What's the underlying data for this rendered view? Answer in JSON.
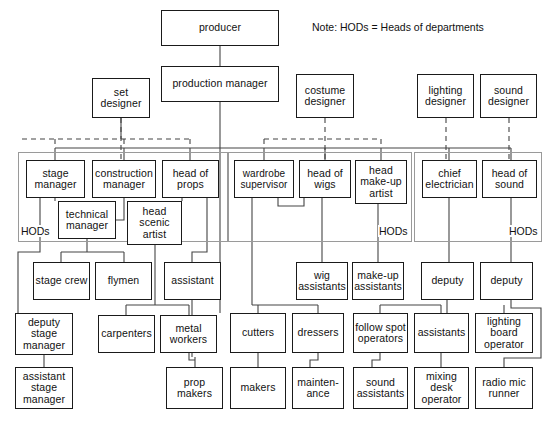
{
  "diagram": {
    "note": "Note: HODs = Heads of departments",
    "group_label": "HODs",
    "colors": {
      "box_border": "#1a1a1a",
      "group_border": "#9a9a9a",
      "line": "#444444",
      "background": "#ffffff",
      "text": "#111111"
    }
  },
  "nodes": [
    {
      "id": "producer",
      "label": "producer",
      "x": 161,
      "y": 10,
      "w": 118,
      "h": 36
    },
    {
      "id": "production-manager",
      "label": "production manager",
      "x": 161,
      "y": 66,
      "w": 118,
      "h": 36
    },
    {
      "id": "set-designer",
      "label": "set designer",
      "x": 92,
      "y": 78,
      "w": 58,
      "h": 40
    },
    {
      "id": "costume-designer",
      "label": "costume designer",
      "x": 296,
      "y": 74,
      "w": 58,
      "h": 44
    },
    {
      "id": "lighting-designer",
      "label": "lighting designer",
      "x": 417,
      "y": 74,
      "w": 57,
      "h": 44
    },
    {
      "id": "sound-designer",
      "label": "sound designer",
      "x": 480,
      "y": 74,
      "w": 57,
      "h": 44
    },
    {
      "id": "stage-manager",
      "label": "stage manager",
      "x": 26,
      "y": 160,
      "w": 59,
      "h": 38
    },
    {
      "id": "construction-manager",
      "label": "construction manager",
      "x": 92,
      "y": 160,
      "w": 64,
      "h": 38
    },
    {
      "id": "head-of-props",
      "label": "head of props",
      "x": 162,
      "y": 160,
      "w": 57,
      "h": 38
    },
    {
      "id": "technical-manager",
      "label": "technical manager",
      "x": 58,
      "y": 201,
      "w": 58,
      "h": 38
    },
    {
      "id": "head-scenic-artist",
      "label": "head scenic artist",
      "x": 127,
      "y": 201,
      "w": 55,
      "h": 44
    },
    {
      "id": "wardrobe-supervisor",
      "label": "wardrobe supervisor",
      "x": 234,
      "y": 160,
      "w": 60,
      "h": 38
    },
    {
      "id": "head-of-wigs",
      "label": "head of wigs",
      "x": 299,
      "y": 160,
      "w": 52,
      "h": 38
    },
    {
      "id": "head-make-up-artist",
      "label": "head make-up artist",
      "x": 355,
      "y": 160,
      "w": 52,
      "h": 44
    },
    {
      "id": "chief-electrician",
      "label": "chief electrician",
      "x": 422,
      "y": 160,
      "w": 55,
      "h": 38
    },
    {
      "id": "head-of-sound",
      "label": "head of sound",
      "x": 482,
      "y": 160,
      "w": 55,
      "h": 38
    },
    {
      "id": "stage-crew",
      "label": "stage crew",
      "x": 33,
      "y": 262,
      "w": 57,
      "h": 38
    },
    {
      "id": "flymen",
      "label": "flymen",
      "x": 95,
      "y": 262,
      "w": 57,
      "h": 38
    },
    {
      "id": "assistant",
      "label": "assistant",
      "x": 164,
      "y": 262,
      "w": 57,
      "h": 38
    },
    {
      "id": "deputy-stage-manager",
      "label": "deputy stage manager",
      "x": 15,
      "y": 313,
      "w": 58,
      "h": 42
    },
    {
      "id": "carpenters",
      "label": "carpenters",
      "x": 98,
      "y": 315,
      "w": 57,
      "h": 38
    },
    {
      "id": "metal-workers",
      "label": "metal workers",
      "x": 160,
      "y": 315,
      "w": 57,
      "h": 38
    },
    {
      "id": "assistant-stage-manager",
      "label": "assistant stage manager",
      "x": 15,
      "y": 367,
      "w": 58,
      "h": 42
    },
    {
      "id": "prop-makers",
      "label": "prop makers",
      "x": 166,
      "y": 367,
      "w": 57,
      "h": 42
    },
    {
      "id": "wig-assistants",
      "label": "wig assistants",
      "x": 296,
      "y": 262,
      "w": 52,
      "h": 38
    },
    {
      "id": "make-up-assistants",
      "label": "make-up assistants",
      "x": 352,
      "y": 262,
      "w": 52,
      "h": 38
    },
    {
      "id": "cutters",
      "label": "cutters",
      "x": 230,
      "y": 313,
      "w": 56,
      "h": 40
    },
    {
      "id": "dressers",
      "label": "dressers",
      "x": 292,
      "y": 313,
      "w": 52,
      "h": 40
    },
    {
      "id": "makers",
      "label": "makers",
      "x": 230,
      "y": 367,
      "w": 56,
      "h": 42
    },
    {
      "id": "maintenance",
      "label": "mainten- ance",
      "x": 292,
      "y": 367,
      "w": 52,
      "h": 42
    },
    {
      "id": "deputy-lighting",
      "label": "deputy",
      "x": 421,
      "y": 262,
      "w": 53,
      "h": 38
    },
    {
      "id": "deputy-sound",
      "label": "deputy",
      "x": 480,
      "y": 262,
      "w": 53,
      "h": 38
    },
    {
      "id": "follow-spot-operators",
      "label": "follow spot operators",
      "x": 353,
      "y": 313,
      "w": 55,
      "h": 40
    },
    {
      "id": "assistants",
      "label": "assistants",
      "x": 414,
      "y": 313,
      "w": 55,
      "h": 40
    },
    {
      "id": "lighting-board-operator",
      "label": "lighting board operator",
      "x": 475,
      "y": 313,
      "w": 58,
      "h": 40
    },
    {
      "id": "sound-assistants",
      "label": "sound assistants",
      "x": 353,
      "y": 367,
      "w": 55,
      "h": 42
    },
    {
      "id": "mixing-desk-operator",
      "label": "mixing desk operator",
      "x": 414,
      "y": 367,
      "w": 55,
      "h": 42
    },
    {
      "id": "radio-mic-runner",
      "label": "radio mic runner",
      "x": 475,
      "y": 367,
      "w": 58,
      "h": 42
    }
  ],
  "groups": [
    {
      "id": "hod-stage",
      "x": 18,
      "y": 152,
      "w": 210,
      "h": 90,
      "label_x": 20,
      "label_y": 225
    },
    {
      "id": "hod-wardrobe",
      "x": 228,
      "y": 152,
      "w": 184,
      "h": 90,
      "label_x": 378,
      "label_y": 225
    },
    {
      "id": "hod-lx",
      "x": 414,
      "y": 152,
      "w": 128,
      "h": 90,
      "label_x": 508,
      "label_y": 225
    }
  ],
  "note_position": {
    "x": 312,
    "y": 21
  }
}
